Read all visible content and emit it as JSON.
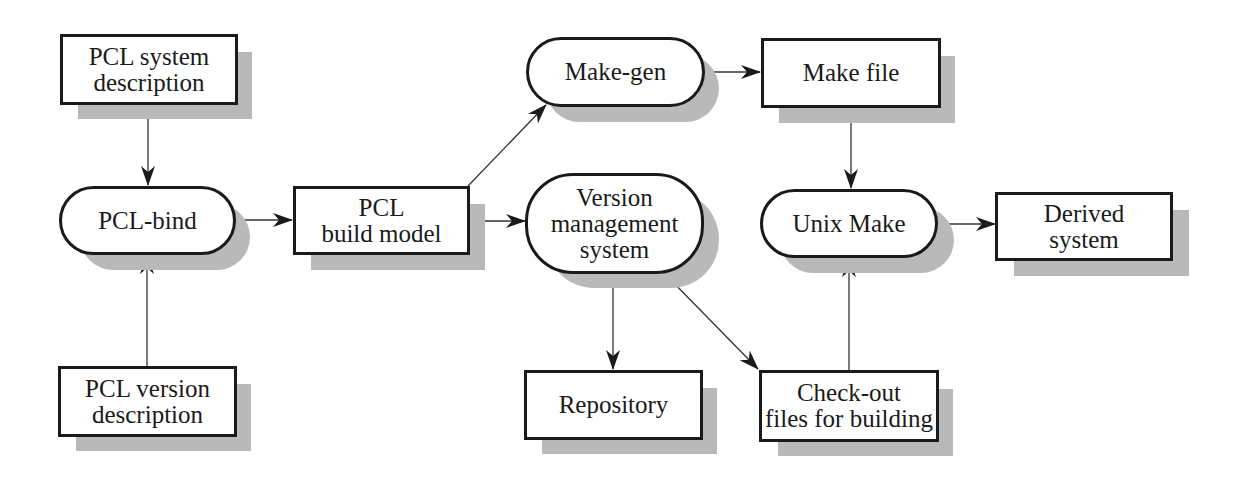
{
  "diagram": {
    "type": "flowchart",
    "nodes": {
      "pcl_system_description": {
        "shape": "rectangle",
        "lines": [
          "PCL system",
          "description"
        ]
      },
      "pcl_bind": {
        "shape": "rounded",
        "lines": [
          "PCL-bind"
        ]
      },
      "pcl_version_description": {
        "shape": "rectangle",
        "lines": [
          "PCL version",
          "description"
        ]
      },
      "pcl_build_model": {
        "shape": "rectangle",
        "lines": [
          "PCL",
          "build model"
        ]
      },
      "make_gen": {
        "shape": "rounded",
        "lines": [
          "Make-gen"
        ]
      },
      "version_management_system": {
        "shape": "rounded",
        "lines": [
          "Version",
          "management",
          "system"
        ]
      },
      "repository": {
        "shape": "rectangle",
        "lines": [
          "Repository"
        ]
      },
      "make_file": {
        "shape": "rectangle",
        "lines": [
          "Make file"
        ]
      },
      "unix_make": {
        "shape": "rounded",
        "lines": [
          "Unix Make"
        ]
      },
      "check_out_files": {
        "shape": "rectangle",
        "lines": [
          "Check-out",
          "files for building"
        ]
      },
      "derived_system": {
        "shape": "rectangle",
        "lines": [
          "Derived",
          "system"
        ]
      }
    },
    "edges": [
      {
        "from": "PCL system description",
        "to": "PCL-bind"
      },
      {
        "from": "PCL version description",
        "to": "PCL-bind"
      },
      {
        "from": "PCL-bind",
        "to": "PCL build model"
      },
      {
        "from": "PCL build model",
        "to": "Make-gen"
      },
      {
        "from": "PCL build model",
        "to": "Version management system"
      },
      {
        "from": "Make-gen",
        "to": "Make file"
      },
      {
        "from": "Make file",
        "to": "Unix Make"
      },
      {
        "from": "Version management system",
        "to": "Repository",
        "bidirectional": true
      },
      {
        "from": "Version management system",
        "to": "Check-out files for building"
      },
      {
        "from": "Check-out files for building",
        "to": "Unix Make"
      },
      {
        "from": "Unix Make",
        "to": "Derived system"
      }
    ],
    "colors": {
      "stroke": "#1a1a1a",
      "shadow": "#b9b9b9",
      "fill": "#ffffff"
    }
  }
}
